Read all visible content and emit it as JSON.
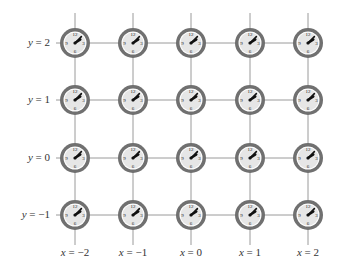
{
  "diagram": {
    "columns": [
      {
        "label_var": "x",
        "label_value": "−2",
        "cx": 75
      },
      {
        "label_var": "x",
        "label_value": "−1",
        "cx": 133
      },
      {
        "label_var": "x",
        "label_value": "0",
        "cx": 191
      },
      {
        "label_var": "x",
        "label_value": "1",
        "cx": 250
      },
      {
        "label_var": "x",
        "label_value": "2",
        "cx": 308
      }
    ],
    "rows": [
      {
        "label_var": "y",
        "label_value": "2",
        "cy": 43
      },
      {
        "label_var": "y",
        "label_value": "1",
        "cy": 100
      },
      {
        "label_var": "y",
        "label_value": "0",
        "cy": 158
      },
      {
        "label_var": "y",
        "label_value": "−1",
        "cy": 215
      }
    ],
    "clock": {
      "numerals": [
        "12",
        "3",
        "6",
        "9"
      ],
      "hour_hand_angle_deg": 55,
      "minute_hand_angle_deg": 45,
      "face_color": "#e6e6e6",
      "ring_color": "#707070",
      "hand_color": "#111111"
    },
    "grid_line_color": "#9a9a9a"
  }
}
